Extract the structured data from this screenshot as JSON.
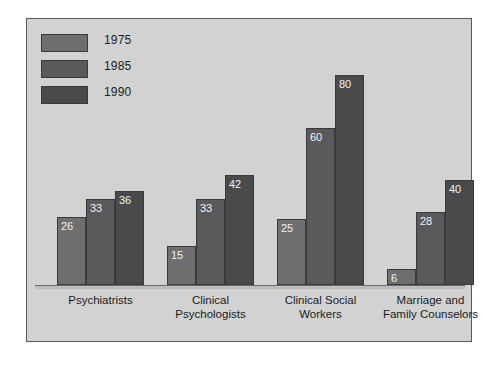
{
  "chart_data": {
    "type": "bar",
    "title": "",
    "subtitle": "",
    "xlabel": "",
    "ylabel": "",
    "ylim": [
      0,
      80
    ],
    "grid": false,
    "legend_position": "top-left",
    "categories": [
      "Psychiatrists",
      "Clinical\nPsychologists",
      "Clinical Social\nWorkers",
      "Marriage and\nFamily Counselors"
    ],
    "series": [
      {
        "name": "1975",
        "color": "#6f6f71",
        "values": [
          26,
          15,
          25,
          6
        ]
      },
      {
        "name": "1985",
        "color": "#5a5a5c",
        "values": [
          33,
          33,
          60,
          28
        ]
      },
      {
        "name": "1990",
        "color": "#4a4a4c",
        "values": [
          36,
          42,
          80,
          40
        ]
      }
    ],
    "value_labels": {
      "Psychiatrists": [
        "26",
        "33",
        "36"
      ],
      "Clinical Psychologists": [
        "15",
        "33",
        "42"
      ],
      "Clinical Social Workers": [
        "25",
        "60",
        "80"
      ],
      "Marriage and Family Counselors": [
        "6",
        "28",
        "40"
      ]
    }
  },
  "legend": {
    "items": [
      {
        "label": "1975",
        "color": "#6f6f71"
      },
      {
        "label": "1985",
        "color": "#5a5a5c"
      },
      {
        "label": "1990",
        "color": "#4a4a4c"
      }
    ]
  },
  "colors": {
    "panel_background": "#d2d2d2",
    "frame_border": "#58585a",
    "bar_border": "#3a3a3c",
    "value_label_text": "#f2f2f2",
    "axis_text": "#1b1b1b",
    "baseline": "#6b6b6d",
    "page_background": "#ffffff"
  }
}
